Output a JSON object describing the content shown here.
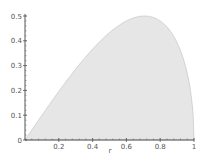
{
  "chart_data": {
    "type": "area",
    "title": "",
    "xlabel": "r",
    "ylabel": "",
    "xlim": [
      0,
      1
    ],
    "ylim": [
      0,
      0.5
    ],
    "grid": false,
    "legend": null,
    "function": "y = r*sqrt(1-r^2)",
    "x_ticks": [
      "0.2",
      "0.4",
      "0.6",
      "0.8",
      "1"
    ],
    "y_ticks": [
      "0",
      "0.1",
      "0.2",
      "0.3",
      "0.4",
      "0.5"
    ],
    "x": [
      0,
      0.1,
      0.2,
      0.3,
      0.4,
      0.5,
      0.6,
      0.7,
      0.707,
      0.8,
      0.9,
      0.95,
      1.0
    ],
    "values": [
      0,
      0.0995,
      0.196,
      0.286,
      0.367,
      0.433,
      0.48,
      0.4999,
      0.5,
      0.48,
      0.392,
      0.297,
      0
    ],
    "fill_color": "#e6e6e6",
    "line_color": "#bdbdbd",
    "axis_color": "#555555"
  }
}
